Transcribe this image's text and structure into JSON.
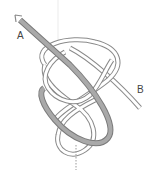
{
  "diagram": {
    "type": "knot-tying-diagram",
    "labels": {
      "end_a": "A",
      "end_b": "B"
    },
    "colors": {
      "rope_outline": "#8a8a8a",
      "rope_fill": "#ffffff",
      "working_end_fill": "#a9a9a9",
      "working_end_outline": "#7a7a7a",
      "guide_line": "#bdbdbd",
      "arrow": "#8a8a8a"
    }
  }
}
